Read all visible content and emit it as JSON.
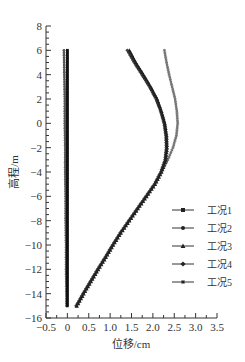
{
  "chart_data": {
    "type": "line",
    "title": "",
    "xlabel": "位移/cm",
    "ylabel": "高程/m",
    "xlim": [
      -0.5,
      3.5
    ],
    "ylim": [
      -16,
      8
    ],
    "xticks": [
      -0.5,
      0,
      0.5,
      1.0,
      1.5,
      2.0,
      2.5,
      3.0,
      3.5
    ],
    "xtick_labels": [
      "-0.5",
      "0",
      "0.5",
      "1.0",
      "1.5",
      "2.0",
      "2.5",
      "3.0",
      "3.5"
    ],
    "yticks": [
      8,
      6,
      4,
      2,
      0,
      -2,
      -4,
      -6,
      -8,
      -10,
      -12,
      -14,
      -16
    ],
    "ytick_labels": [
      "8",
      "6",
      "4",
      "2",
      "0",
      "-2",
      "-4",
      "-6",
      "-8",
      "-10",
      "-12",
      "-14",
      "-16"
    ],
    "grid": false,
    "legend_position": "right-middle-inside",
    "series": [
      {
        "name": "工况1",
        "marker": "square",
        "color": "#111111",
        "y": [
          6,
          4,
          2,
          0,
          -2,
          -4,
          -6,
          -8,
          -10,
          -12,
          -14,
          -15
        ],
        "x": [
          0.0,
          0.0,
          0.0,
          0.0,
          0.0,
          0.0,
          0.0,
          0.0,
          0.0,
          0.0,
          0.0,
          0.0
        ]
      },
      {
        "name": "工况2",
        "marker": "circle",
        "color": "#555555",
        "y": [
          6,
          4,
          2,
          0,
          -2,
          -4,
          -6,
          -8,
          -10,
          -12,
          -14,
          -15
        ],
        "x": [
          -0.08,
          -0.07,
          -0.06,
          -0.06,
          -0.05,
          -0.05,
          -0.04,
          -0.04,
          -0.03,
          -0.03,
          -0.02,
          -0.02
        ]
      },
      {
        "name": "工况3",
        "marker": "triangle",
        "color": "#222222",
        "y": [
          6,
          5,
          4,
          3,
          2,
          1,
          0,
          -1,
          -2,
          -3,
          -4,
          -5,
          -6,
          -7,
          -8,
          -9,
          -10,
          -11,
          -12,
          -13,
          -14,
          -15
        ],
        "x": [
          1.45,
          1.6,
          1.78,
          1.95,
          2.1,
          2.2,
          2.28,
          2.32,
          2.33,
          2.3,
          2.2,
          2.05,
          1.85,
          1.65,
          1.45,
          1.25,
          1.07,
          0.9,
          0.72,
          0.55,
          0.38,
          0.22
        ]
      },
      {
        "name": "工况4",
        "marker": "diamond",
        "color": "#444444",
        "y": [
          6,
          5,
          4,
          3,
          2,
          1,
          0,
          -1,
          -2,
          -3,
          -4,
          -5,
          -6,
          -7,
          -8,
          -9,
          -10,
          -11,
          -12,
          -13,
          -14,
          -15
        ],
        "x": [
          1.4,
          1.56,
          1.74,
          1.92,
          2.07,
          2.18,
          2.26,
          2.3,
          2.31,
          2.28,
          2.18,
          2.03,
          1.83,
          1.63,
          1.43,
          1.23,
          1.05,
          0.88,
          0.7,
          0.53,
          0.36,
          0.2
        ]
      },
      {
        "name": "工况5",
        "marker": "star",
        "color": "#777777",
        "y": [
          6,
          5,
          4,
          3,
          2,
          1,
          0,
          -1,
          -2,
          -3,
          -4,
          -5,
          -6,
          -7,
          -8,
          -9,
          -10,
          -11,
          -12,
          -13,
          -14,
          -15
        ],
        "x": [
          2.27,
          2.32,
          2.38,
          2.45,
          2.52,
          2.56,
          2.58,
          2.55,
          2.47,
          2.35,
          2.2,
          2.05,
          1.85,
          1.65,
          1.45,
          1.25,
          1.07,
          0.9,
          0.72,
          0.55,
          0.38,
          0.22
        ]
      }
    ]
  }
}
